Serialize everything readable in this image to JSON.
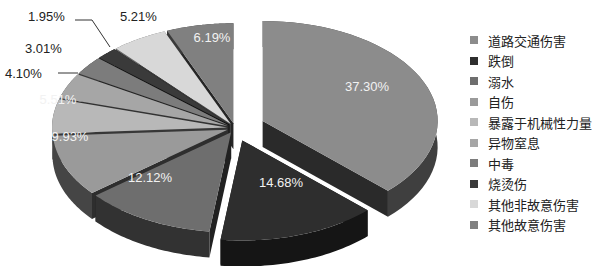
{
  "chart_data": {
    "type": "pie",
    "style": "3d-exploded",
    "title": "",
    "categories": [
      "道路交通伤害",
      "跌倒",
      "溺水",
      "自伤",
      "暴露于机械性力量",
      "异物窒息",
      "中毒",
      "烧烫伤",
      "其他非故意伤害",
      "其他故意伤害"
    ],
    "values": [
      37.3,
      14.68,
      12.12,
      9.93,
      5.51,
      4.1,
      3.01,
      1.95,
      5.21,
      6.19
    ],
    "labels": [
      "37.30%",
      "14.68%",
      "12.12%",
      "9.93%",
      "5.51%",
      "4.10%",
      "3.01%",
      "1.95%",
      "5.21%",
      "6.19%"
    ],
    "colors": [
      "#8c8c8c",
      "#2e2e2e",
      "#6e6e6e",
      "#9a9a9a",
      "#b8b8b8",
      "#a6a6a6",
      "#7c7c7c",
      "#3a3a3a",
      "#d8d8d8",
      "#808080"
    ],
    "legend_position": "right"
  },
  "legend": {
    "items": [
      {
        "label": "道路交通伤害",
        "color": "#8c8c8c"
      },
      {
        "label": "跌倒",
        "color": "#2e2e2e"
      },
      {
        "label": "溺水",
        "color": "#6e6e6e"
      },
      {
        "label": "自伤",
        "color": "#9a9a9a"
      },
      {
        "label": "暴露于机械性力量",
        "color": "#b8b8b8"
      },
      {
        "label": "异物窒息",
        "color": "#a6a6a6"
      },
      {
        "label": "中毒",
        "color": "#7c7c7c"
      },
      {
        "label": "烧烫伤",
        "color": "#3a3a3a"
      },
      {
        "label": "其他非故意伤害",
        "color": "#d8d8d8"
      },
      {
        "label": "其他故意伤害",
        "color": "#808080"
      }
    ]
  }
}
